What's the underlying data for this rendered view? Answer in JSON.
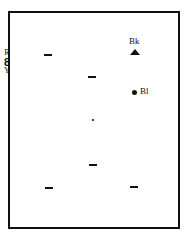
{
  "side_label": {
    "top": "R",
    "middle": "8",
    "bottom": "Y"
  },
  "markers": {
    "bk": {
      "label": "Bk",
      "shape": "triangle-icon"
    },
    "bl": {
      "label": "Bl",
      "shape": "dot-icon"
    }
  },
  "elements": [
    {
      "type": "dash",
      "x": 44,
      "y": 55
    },
    {
      "type": "dash",
      "x": 88,
      "y": 77
    },
    {
      "type": "dot-small",
      "x": 92,
      "y": 120
    },
    {
      "type": "dash",
      "x": 89,
      "y": 165
    },
    {
      "type": "dash",
      "x": 45,
      "y": 188
    },
    {
      "type": "dash",
      "x": 130,
      "y": 187
    }
  ],
  "colors": {
    "ink": "#111111",
    "background": "#ffffff"
  }
}
